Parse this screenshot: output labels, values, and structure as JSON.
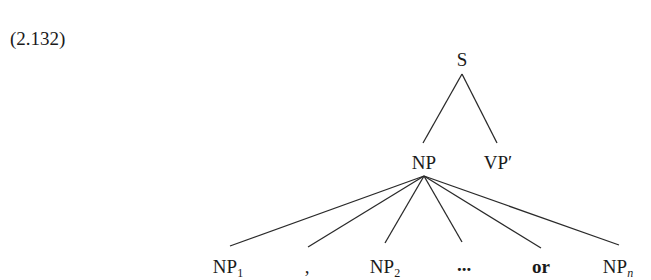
{
  "example": {
    "number": "(2.132)"
  },
  "tree": {
    "root": {
      "label": "S"
    },
    "level1": [
      {
        "label": "NP"
      },
      {
        "label": "VP′"
      }
    ],
    "level2": [
      {
        "base": "NP",
        "sub": "1"
      },
      {
        "text": ","
      },
      {
        "base": "NP",
        "sub": "2"
      },
      {
        "text": "..."
      },
      {
        "text": "or"
      },
      {
        "base": "NP",
        "sub": "n"
      }
    ]
  }
}
